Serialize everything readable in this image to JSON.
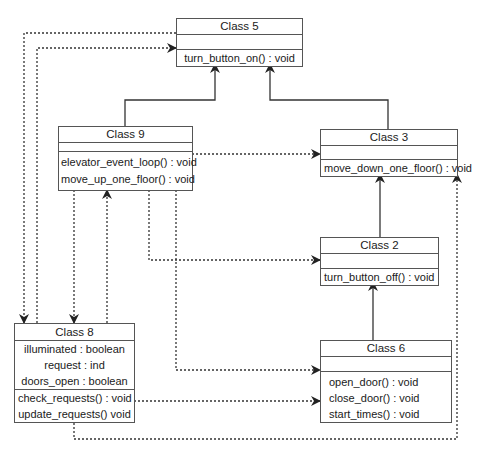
{
  "classes": {
    "class5": {
      "name": "Class 5",
      "attributes": [],
      "methods": [
        "turn_button_on() : void"
      ]
    },
    "class9": {
      "name": "Class 9",
      "attributes": [],
      "methods": [
        "elevator_event_loop() : void",
        "move_up_one_floor() : void"
      ]
    },
    "class3": {
      "name": "Class 3",
      "attributes": [],
      "methods": [
        "move_down_one_floor() : void"
      ]
    },
    "class2": {
      "name": "Class 2",
      "attributes": [],
      "methods": [
        "turn_button_off() : void"
      ]
    },
    "class6": {
      "name": "Class 6",
      "attributes": [],
      "methods": [
        "open_door() : void",
        "close_door() : void",
        "start_times() : void"
      ]
    },
    "class8": {
      "name": "Class 8",
      "attributes": [
        "illuminated : boolean",
        "request : ind",
        "doors_open : boolean"
      ],
      "methods": [
        "check_requests() : void",
        "update_requests() void"
      ]
    }
  },
  "relationships": [
    {
      "type": "inheritance",
      "from": "Class 9",
      "to": "Class 5"
    },
    {
      "type": "inheritance",
      "from": "Class 3",
      "to": "Class 5"
    },
    {
      "type": "inheritance",
      "from": "Class 2",
      "to": "Class 3"
    },
    {
      "type": "inheritance",
      "from": "Class 6",
      "to": "Class 2"
    },
    {
      "type": "dependency",
      "from": "Class 9",
      "to": "Class 3"
    },
    {
      "type": "dependency",
      "from": "Class 9",
      "to": "Class 2"
    },
    {
      "type": "dependency",
      "from": "Class 9",
      "to": "Class 6"
    },
    {
      "type": "dependency",
      "from": "Class 9",
      "to": "Class 8"
    },
    {
      "type": "dependency",
      "from": "Class 8",
      "to": "Class 9"
    },
    {
      "type": "dependency",
      "from": "Class 8",
      "to": "Class 5"
    },
    {
      "type": "dependency",
      "from": "Class 5",
      "to": "Class 8"
    },
    {
      "type": "dependency",
      "from": "Class 8",
      "to": "Class 6"
    },
    {
      "type": "dependency",
      "from": "Class 8",
      "to": "Class 3"
    }
  ],
  "colors": {
    "line": "#333333",
    "border": "#555555",
    "background": "#ffffff"
  }
}
